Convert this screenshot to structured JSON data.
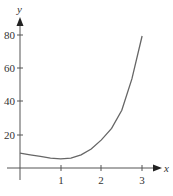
{
  "chart_data": {
    "type": "line",
    "title": "",
    "xlabel": "x",
    "ylabel": "y",
    "x_ticks": [
      "1",
      "2",
      "3"
    ],
    "y_ticks": [
      "20",
      "40",
      "60",
      "80"
    ],
    "xlim": [
      0,
      3.3
    ],
    "ylim": [
      0,
      90
    ],
    "grid": false,
    "series": [
      {
        "name": "curve",
        "x": [
          0,
          0.25,
          0.5,
          0.75,
          1.0,
          1.25,
          1.5,
          1.75,
          2.0,
          2.25,
          2.5,
          2.75,
          3.0
        ],
        "y": [
          9,
          8,
          7,
          6,
          5.5,
          6,
          8,
          11.5,
          17,
          24,
          35,
          54,
          80
        ]
      }
    ]
  },
  "axis": {
    "x_label": "x",
    "y_label": "y",
    "x_tick_labels": [
      "1",
      "2",
      "3"
    ],
    "y_tick_labels": [
      "20",
      "40",
      "60",
      "80"
    ]
  }
}
